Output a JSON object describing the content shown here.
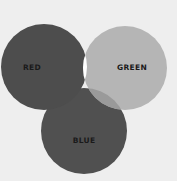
{
  "diagram": {
    "type": "venn",
    "background": "#eeeeee",
    "sets": [
      {
        "name": "RED",
        "label": "RED",
        "color": "#4d4d4d",
        "cx": 44,
        "cy": 67,
        "r": 43,
        "label_x": 32,
        "label_y": 70
      },
      {
        "name": "GREEN",
        "label": "GREEN",
        "color": "#b5b5b5",
        "cx": 125,
        "cy": 68,
        "r": 42,
        "label_x": 132,
        "label_y": 70
      },
      {
        "name": "BLUE",
        "label": "BLUE",
        "color": "#505050",
        "cx": 84,
        "cy": 131,
        "r": 43,
        "label_x": 84,
        "label_y": 143
      }
    ],
    "intersections": {
      "red_green": "#ffffff",
      "green_blue": "#9a9a9a",
      "red_blue": "#4a4a4a",
      "center": "#ffffff"
    }
  }
}
